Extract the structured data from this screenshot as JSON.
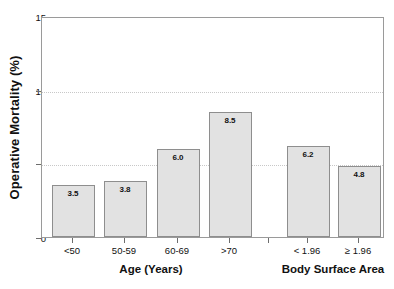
{
  "chart_data": {
    "type": "bar",
    "title": "",
    "subtitle": "",
    "xlabel": "",
    "ylabel": "Operative Mortality (%)",
    "ylim": [
      0,
      15
    ],
    "yticks": [
      0,
      5,
      10,
      15
    ],
    "ytick_labels": [
      "0",
      "5",
      "10",
      "15"
    ],
    "grid": "horizontal dotted gridlines at 5 and 10",
    "gridlines": [
      5,
      10
    ],
    "legend": "none",
    "legend_position": "none",
    "orientation": "vertical",
    "categories": [
      "<50",
      "50-59",
      "60-69",
      ">70",
      "< 1.96",
      "≥ 1.96"
    ],
    "values": [
      3.5,
      3.8,
      6.0,
      8.5,
      6.2,
      4.8
    ],
    "value_labels": [
      "3.5",
      "3.8",
      "6.0",
      "8.5",
      "6.2",
      "4.8"
    ],
    "groups": [
      {
        "name": "Age (Years)",
        "categories": [
          "<50",
          "50-59",
          "60-69",
          ">70"
        ],
        "values": [
          3.5,
          3.8,
          6.0,
          8.5
        ]
      },
      {
        "name": "Body Surface Area",
        "categories": [
          "< 1.96",
          "≥ 1.96"
        ],
        "values": [
          6.2,
          4.8
        ]
      }
    ],
    "bar_fill_color": "#e2e2e2",
    "bar_edge_color": "#8e8e8e",
    "axis_color": "#9a9a9a",
    "grid_color": "#c8c8c8"
  },
  "axes": {
    "y_title": "Operative Mortality (%)",
    "y_ticks": [
      {
        "label": "15",
        "value": 15
      },
      {
        "label": "10",
        "value": 10
      },
      {
        "label": "5",
        "value": 5
      },
      {
        "label": "0",
        "value": 0
      }
    ]
  },
  "bars": [
    {
      "label": "<50",
      "value": 3.5,
      "value_label": "3.5",
      "group": "age"
    },
    {
      "label": "50-59",
      "value": 3.8,
      "value_label": "3.8",
      "group": "age"
    },
    {
      "label": "60-69",
      "value": 6.0,
      "value_label": "6.0",
      "group": "age"
    },
    {
      "label": ">70",
      "value": 8.5,
      "value_label": "8.5",
      "group": "age"
    },
    {
      "label": "< 1.96",
      "value": 6.2,
      "value_label": "6.2",
      "group": "bsa"
    },
    {
      "label": "≥ 1.96",
      "value": 4.8,
      "value_label": "4.8",
      "group": "bsa"
    }
  ],
  "group_titles": [
    {
      "label": "Age (Years)"
    },
    {
      "label": "Body Surface Area"
    }
  ]
}
